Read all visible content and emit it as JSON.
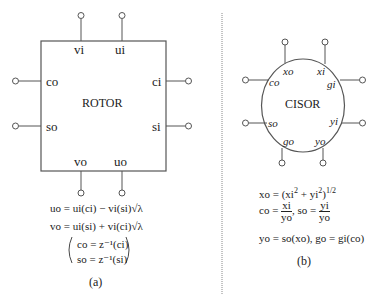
{
  "rotor": {
    "title": "ROTOR",
    "ports": {
      "top": [
        "vi",
        "ui"
      ],
      "left": [
        "co",
        "so"
      ],
      "right": [
        "ci",
        "si"
      ],
      "bottom": [
        "vo",
        "uo"
      ]
    },
    "equations": {
      "eq1": "uo = ui(ci) − vi(si)√λ",
      "eq2": "vo = ui(si) + vi(ci)√λ",
      "eq3": "co = z⁻¹(ci)",
      "eq4": "so = z⁻¹(si)"
    },
    "caption": "(a)"
  },
  "cisor": {
    "title": "CISOR",
    "ports": {
      "top": [
        "xo",
        "xi"
      ],
      "left": [
        "co",
        "so"
      ],
      "right": [
        "gi",
        "yi"
      ],
      "bottom": [
        "go",
        "yo"
      ]
    },
    "equations": {
      "eq1_lhs": "xo = (xi",
      "eq1_mid": " + yi",
      "eq1_end": ")",
      "sq": "2",
      "half": "1/2",
      "co_lhs": "co = ",
      "co_num": "xi",
      "co_den": "yo",
      "so_lhs": ",  so = ",
      "so_num": "yi",
      "so_den": "yo",
      "eq3": "yo = so(xo),   go = gi(co)"
    },
    "caption": "(b)"
  },
  "colors": {
    "stroke": "#555555",
    "divider": "#888888",
    "text": "#222222"
  }
}
